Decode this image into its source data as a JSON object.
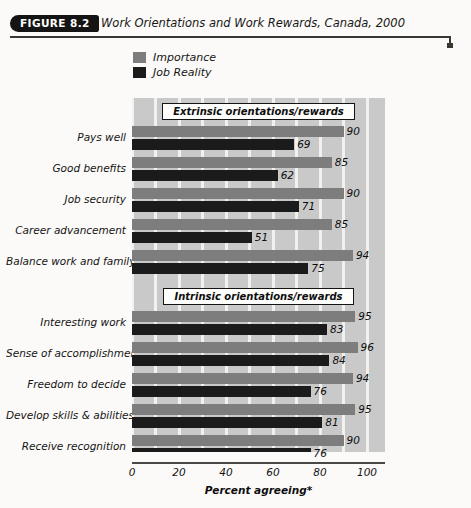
{
  "figure": {
    "badge": "FIGURE 8.2",
    "title": "Work Orientations and Work Rewards, Canada, 2000"
  },
  "legend": {
    "position": "top-left",
    "entries": [
      {
        "label": "Importance",
        "color": "#7d7d7d",
        "icon": "legend-swatch"
      },
      {
        "label": "Job Reality",
        "color": "#1b1b1b",
        "icon": "legend-swatch"
      }
    ]
  },
  "sections": [
    {
      "label": "Extrinsic orientations/rewards"
    },
    {
      "label": "Intrinsic orientations/rewards"
    }
  ],
  "chart_data": {
    "type": "bar",
    "orientation": "horizontal",
    "title": "Work Orientations and Work Rewards, Canada, 2000",
    "xlabel": "Percent agreeing*",
    "ylabel": "",
    "xlim": [
      0,
      100
    ],
    "xticks": [
      0,
      20,
      40,
      60,
      80,
      100
    ],
    "xticklabels": [
      "0",
      "20",
      "40",
      "60",
      "80",
      "100"
    ],
    "grid": true,
    "grid_axis": "x",
    "legend_position": "above-plot-left",
    "categories": [
      "Pays well",
      "Good benefits",
      "Job security",
      "Career advancement",
      "Balance work and family",
      "Interesting work",
      "Sense of accomplishment",
      "Freedom to decide",
      "Develop skills & abilities",
      "Receive recognition"
    ],
    "groups": [
      {
        "name": "Extrinsic orientations/rewards",
        "categories": [
          "Pays well",
          "Good benefits",
          "Job security",
          "Career advancement",
          "Balance work and family"
        ]
      },
      {
        "name": "Intrinsic orientations/rewards",
        "categories": [
          "Interesting work",
          "Sense of accomplishment",
          "Freedom to decide",
          "Develop skills & abilities",
          "Receive recognition"
        ]
      }
    ],
    "series": [
      {
        "name": "Importance",
        "color": "#7d7d7d",
        "values": [
          90,
          85,
          90,
          85,
          94,
          95,
          96,
          94,
          95,
          90
        ]
      },
      {
        "name": "Job Reality",
        "color": "#1b1b1b",
        "values": [
          69,
          62,
          71,
          51,
          75,
          83,
          84,
          76,
          81,
          76
        ]
      }
    ],
    "data_labels": true
  },
  "axis": {
    "title": "Percent agreeing*"
  }
}
